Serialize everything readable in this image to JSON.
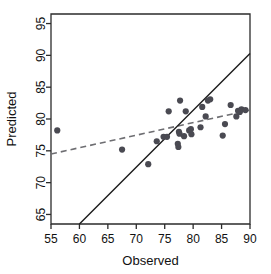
{
  "chart_data": {
    "type": "scatter",
    "title": "",
    "xlabel": "Observed",
    "ylabel": "Predicted",
    "xlim": [
      55,
      90
    ],
    "ylim": [
      63.5,
      96.5
    ],
    "xticks": [
      55,
      60,
      65,
      70,
      75,
      80,
      85,
      90
    ],
    "xtick_labels": [
      "55",
      "60",
      "65",
      "70",
      "75",
      "80",
      "85",
      "90"
    ],
    "yticks": [
      65,
      70,
      75,
      80,
      85,
      90,
      95
    ],
    "ytick_labels": [
      "65",
      "70",
      "75",
      "80",
      "85",
      "90",
      "95"
    ],
    "grid": false,
    "legend": null,
    "point_color": "#4a4a52",
    "identity_line_color": "#1c1c1c",
    "fit_line_color": "#6e6e72",
    "points": [
      {
        "x": 56.1,
        "y": 78.2
      },
      {
        "x": 67.5,
        "y": 75.2
      },
      {
        "x": 72.1,
        "y": 72.9
      },
      {
        "x": 73.6,
        "y": 76.5
      },
      {
        "x": 74.8,
        "y": 77.2
      },
      {
        "x": 75.4,
        "y": 77.2
      },
      {
        "x": 75.7,
        "y": 81.2
      },
      {
        "x": 77.3,
        "y": 76.1
      },
      {
        "x": 77.4,
        "y": 75.6
      },
      {
        "x": 77.5,
        "y": 78.0
      },
      {
        "x": 77.6,
        "y": 77.7
      },
      {
        "x": 77.7,
        "y": 82.9
      },
      {
        "x": 78.4,
        "y": 77.3
      },
      {
        "x": 78.7,
        "y": 81.2
      },
      {
        "x": 79.3,
        "y": 78.2
      },
      {
        "x": 79.6,
        "y": 78.4
      },
      {
        "x": 79.7,
        "y": 77.6
      },
      {
        "x": 81.3,
        "y": 78.7
      },
      {
        "x": 81.6,
        "y": 81.9
      },
      {
        "x": 82.2,
        "y": 80.4
      },
      {
        "x": 82.6,
        "y": 82.9
      },
      {
        "x": 83.0,
        "y": 83.1
      },
      {
        "x": 85.2,
        "y": 77.4
      },
      {
        "x": 85.6,
        "y": 79.2
      },
      {
        "x": 86.6,
        "y": 82.2
      },
      {
        "x": 87.6,
        "y": 80.4
      },
      {
        "x": 87.9,
        "y": 81.3
      },
      {
        "x": 88.2,
        "y": 81.1
      },
      {
        "x": 88.5,
        "y": 81.5
      },
      {
        "x": 89.2,
        "y": 81.4
      }
    ],
    "identity_line": {
      "x0": 60.0,
      "y0": 63.5,
      "x1": 90.0,
      "y1": 90.3
    },
    "fit_line": {
      "x0": 55.0,
      "y0": 74.5,
      "x1": 90.0,
      "y1": 81.4
    }
  }
}
